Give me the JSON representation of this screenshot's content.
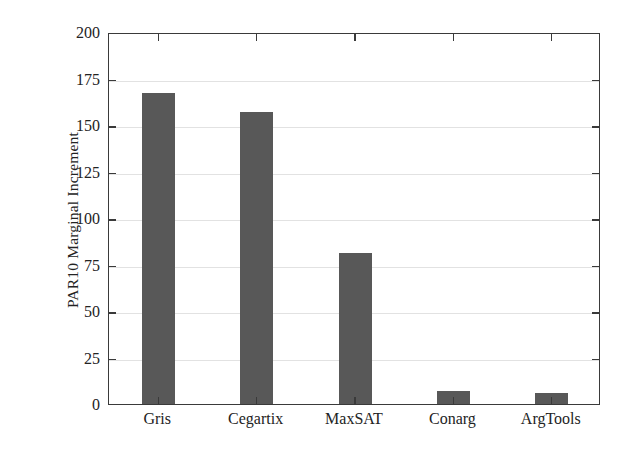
{
  "chart_data": {
    "type": "bar",
    "title": "",
    "xlabel": "",
    "ylabel": "PAR10 Marginal Increment",
    "categories": [
      "Gris",
      "Cegartix",
      "MaxSAT",
      "Conarg",
      "ArgTools"
    ],
    "values": [
      167,
      157,
      81,
      7,
      6
    ],
    "ylim": [
      0,
      200
    ],
    "yticks": [
      0,
      25,
      50,
      75,
      100,
      125,
      150,
      175,
      200
    ],
    "ytick_labels": [
      "0",
      "25",
      "50",
      "75",
      "100",
      "125",
      "150",
      "175",
      "200"
    ],
    "grid": true,
    "legend": "none",
    "bar_color": "#585858",
    "axis_color": "#3a3a3a",
    "grid_color": "#e2e2e2",
    "background": "#ffffff"
  }
}
